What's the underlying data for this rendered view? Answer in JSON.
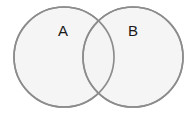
{
  "diagram": {
    "type": "venn",
    "canvas": {
      "width": 191,
      "height": 115,
      "background": "#ffffff"
    },
    "style": {
      "stroke": "#8c8c8c",
      "fill": "#f3f3f3",
      "fill_opacity": 0.85,
      "label_color": "#1a1a1a"
    },
    "sets": [
      {
        "label": "A",
        "cx": 64,
        "cy": 57,
        "r": 50,
        "label_x": 63,
        "label_y": 30
      },
      {
        "label": "B",
        "cx": 133,
        "cy": 57,
        "r": 50,
        "label_x": 133,
        "label_y": 30
      }
    ]
  }
}
